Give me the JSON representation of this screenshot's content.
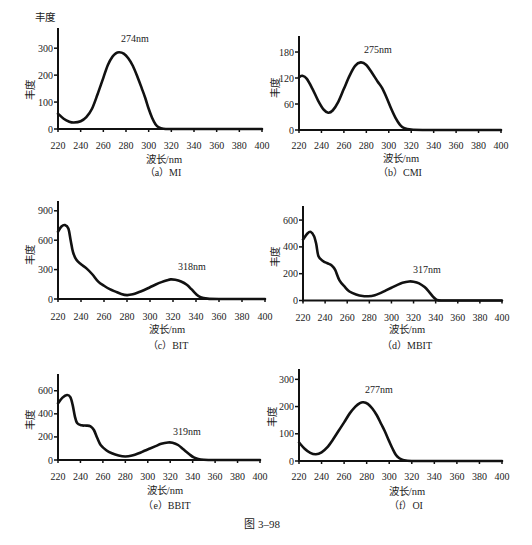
{
  "figure": {
    "corner_label": "丰度",
    "caption": "图 3–98"
  },
  "chart_data": [
    {
      "type": "line",
      "title": "（a）MI",
      "xlabel": "波长/nm",
      "ylabel": "丰度",
      "xlim": [
        220,
        400
      ],
      "ylim": [
        0,
        375
      ],
      "x_ticks": [
        220,
        240,
        260,
        280,
        300,
        320,
        340,
        360,
        380,
        400
      ],
      "y_ticks": [
        0,
        100,
        200,
        300
      ],
      "grid": false,
      "legend": null,
      "annotations": [
        {
          "text": "274nm",
          "x": 274,
          "y": 285
        }
      ],
      "series": [
        {
          "name": "MI",
          "x": [
            220,
            225,
            230,
            234,
            240,
            245,
            250,
            255,
            260,
            264,
            268,
            271,
            274,
            278,
            282,
            286,
            290,
            294,
            297,
            300,
            303,
            306,
            309,
            313,
            320,
            340,
            360,
            380,
            400
          ],
          "y": [
            57,
            38,
            27,
            24,
            29,
            44,
            75,
            130,
            190,
            238,
            268,
            281,
            285,
            280,
            263,
            235,
            195,
            150,
            115,
            75,
            42,
            18,
            6,
            1,
            0,
            0,
            0,
            0,
            0
          ]
        }
      ]
    },
    {
      "type": "line",
      "title": "（b）CMI",
      "xlabel": "波长/nm",
      "ylabel": "丰度",
      "xlim": [
        220,
        400
      ],
      "ylim": [
        0,
        217
      ],
      "x_ticks": [
        220,
        240,
        260,
        280,
        300,
        320,
        340,
        360,
        380,
        400
      ],
      "y_ticks": [
        0,
        60,
        120,
        180
      ],
      "grid": false,
      "legend": null,
      "annotations": [
        {
          "text": "275nm",
          "x": 275,
          "y": 156
        }
      ],
      "series": [
        {
          "name": "CMI",
          "x": [
            220,
            223,
            227,
            232,
            237,
            242,
            246,
            250,
            255,
            260,
            265,
            270,
            275,
            280,
            285,
            290,
            294,
            298,
            302,
            306,
            310,
            314,
            320,
            330,
            345,
            360,
            380,
            400
          ],
          "y": [
            122,
            125,
            118,
            95,
            68,
            47,
            40,
            45,
            65,
            95,
            125,
            148,
            156,
            150,
            132,
            112,
            97,
            75,
            50,
            28,
            12,
            4,
            1,
            0,
            0,
            0,
            0,
            0
          ]
        }
      ]
    },
    {
      "type": "line",
      "title": "（c）BIT",
      "xlabel": "波长/nm",
      "ylabel": "丰度",
      "xlim": [
        220,
        400
      ],
      "ylim": [
        0,
        1000
      ],
      "x_ticks": [
        220,
        240,
        260,
        280,
        300,
        320,
        340,
        360,
        380,
        400
      ],
      "y_ticks": [
        0,
        300,
        600,
        900
      ],
      "grid": false,
      "legend": null,
      "annotations": [
        {
          "text": "318nm",
          "x": 318,
          "y": 200
        }
      ],
      "series": [
        {
          "name": "BIT",
          "x": [
            220,
            223,
            226,
            229,
            231,
            233,
            236,
            240,
            245,
            250,
            255,
            260,
            265,
            270,
            275,
            280,
            285,
            290,
            295,
            300,
            305,
            310,
            315,
            318,
            322,
            327,
            332,
            336,
            340,
            344,
            350,
            360,
            380,
            400
          ],
          "y": [
            687,
            740,
            755,
            720,
            600,
            480,
            400,
            355,
            310,
            250,
            177,
            135,
            100,
            75,
            52,
            40,
            48,
            68,
            92,
            120,
            148,
            172,
            192,
            200,
            196,
            178,
            145,
            100,
            50,
            18,
            4,
            0,
            0,
            0
          ]
        }
      ]
    },
    {
      "type": "line",
      "title": "（d）MBIT",
      "xlabel": "波长/nm",
      "ylabel": "丰度",
      "xlim": [
        220,
        400
      ],
      "ylim": [
        0,
        705
      ],
      "x_ticks": [
        220,
        240,
        260,
        280,
        300,
        320,
        340,
        360,
        380,
        400
      ],
      "y_ticks": [
        0,
        200,
        400,
        600
      ],
      "grid": false,
      "legend": null,
      "annotations": [
        {
          "text": "317nm",
          "x": 317,
          "y": 142
        }
      ],
      "series": [
        {
          "name": "MBIT",
          "x": [
            220,
            224,
            227,
            230,
            232,
            234,
            238,
            242,
            246,
            249,
            253,
            258,
            262,
            268,
            274,
            279,
            285,
            290,
            295,
            300,
            305,
            310,
            316,
            320,
            325,
            330,
            334,
            338,
            341,
            345,
            360,
            380,
            400
          ],
          "y": [
            455,
            500,
            512,
            480,
            420,
            330,
            295,
            278,
            262,
            230,
            150,
            100,
            67,
            45,
            33,
            32,
            40,
            55,
            75,
            95,
            115,
            132,
            142,
            140,
            128,
            100,
            65,
            25,
            5,
            0,
            0,
            0,
            0
          ]
        }
      ]
    },
    {
      "type": "line",
      "title": "（e）BBIT",
      "xlabel": "波长/nm",
      "ylabel": "丰度",
      "xlim": [
        220,
        400
      ],
      "ylim": [
        0,
        745
      ],
      "x_ticks": [
        220,
        240,
        260,
        280,
        300,
        320,
        340,
        360,
        380,
        400
      ],
      "y_ticks": [
        0,
        200,
        400,
        600
      ],
      "grid": false,
      "legend": null,
      "annotations": [
        {
          "text": "319nm",
          "x": 319,
          "y": 152
        }
      ],
      "series": [
        {
          "name": "BBIT",
          "x": [
            220,
            224,
            228,
            231,
            233,
            235,
            237,
            241,
            245,
            249,
            252,
            255,
            258,
            263,
            268,
            274,
            280,
            286,
            292,
            297,
            302,
            307,
            312,
            318,
            322,
            327,
            332,
            337,
            341,
            345,
            350,
            360,
            380,
            400
          ],
          "y": [
            491,
            540,
            563,
            545,
            480,
            380,
            320,
            300,
            298,
            292,
            260,
            190,
            130,
            85,
            58,
            38,
            30,
            38,
            58,
            80,
            100,
            120,
            140,
            152,
            150,
            130,
            90,
            50,
            22,
            8,
            2,
            0,
            0,
            0
          ]
        }
      ]
    },
    {
      "type": "line",
      "title": "（f）OI",
      "xlabel": "波长/nm",
      "ylabel": "丰度",
      "xlim": [
        220,
        400
      ],
      "ylim": [
        0,
        338
      ],
      "x_ticks": [
        220,
        240,
        260,
        280,
        300,
        320,
        340,
        360,
        380,
        400
      ],
      "y_ticks": [
        0,
        100,
        200,
        300
      ],
      "grid": false,
      "legend": null,
      "annotations": [
        {
          "text": "277nm",
          "x": 277,
          "y": 216
        }
      ],
      "series": [
        {
          "name": "OI",
          "x": [
            220,
            225,
            230,
            235,
            240,
            245,
            250,
            255,
            260,
            265,
            270,
            274,
            277,
            281,
            285,
            289,
            293,
            296,
            300,
            303,
            306,
            309,
            313,
            320,
            340,
            360,
            380,
            400
          ],
          "y": [
            68,
            45,
            30,
            25,
            32,
            50,
            78,
            110,
            142,
            175,
            200,
            213,
            216,
            210,
            193,
            168,
            135,
            110,
            72,
            45,
            22,
            10,
            3,
            0,
            0,
            0,
            0,
            0
          ]
        }
      ]
    }
  ]
}
